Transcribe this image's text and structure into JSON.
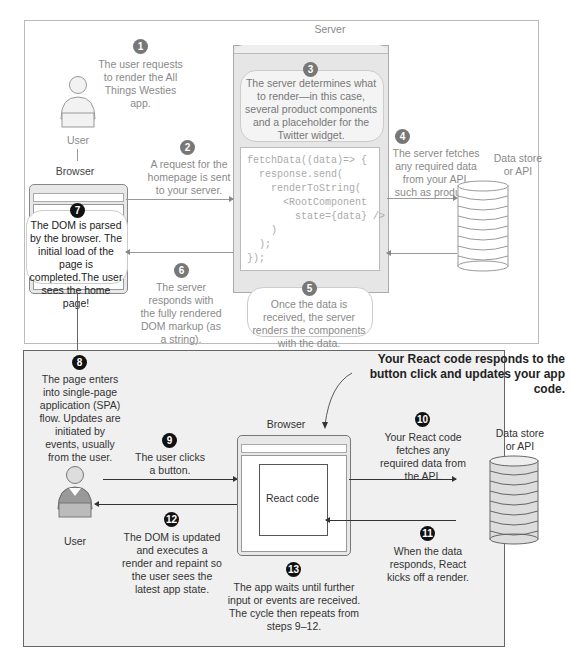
{
  "top_section": {
    "server_label": "Server",
    "user_label": "User",
    "browser_label": "Browser",
    "datastore_label": "Data store\nor API",
    "steps": [
      {
        "n": "1",
        "text": "The user requests to render the All Things Westies app."
      },
      {
        "n": "2",
        "text": "A request for the homepage is sent to your server."
      },
      {
        "n": "3",
        "text": "The server determines what to render—in this case, several product components and a placeholder for the Twitter widget."
      },
      {
        "n": "4",
        "text": "The server fetches any required data from your API, such as products."
      },
      {
        "n": "5",
        "text": "Once the data is received, the server renders the components with the data."
      },
      {
        "n": "6",
        "text": "The server responds with the fully rendered DOM markup (as a string)."
      },
      {
        "n": "7",
        "text": "The DOM is parsed by the browser. The initial load of the page is completed.The user sees the home page!"
      }
    ],
    "code_lines": [
      "fetchData((data)=> {",
      "  response.send(",
      "    renderToString(",
      "      <RootComponent",
      "        state={data} />",
      "    )",
      "  );",
      "});"
    ]
  },
  "bottom_section": {
    "callout": "Your React code responds to the button click and updates your app code.",
    "browser_label": "Browser",
    "react_code_label": "React code",
    "user_label": "User",
    "datastore_label": "Data store\nor API",
    "steps": [
      {
        "n": "8",
        "text": "The page enters into single-page application (SPA) flow. Updates are initiated by events, usually from the user."
      },
      {
        "n": "9",
        "text": "The user clicks a button."
      },
      {
        "n": "10",
        "text": "Your React code fetches any required data from the API."
      },
      {
        "n": "11",
        "text": "When the data responds, React kicks off a render."
      },
      {
        "n": "12",
        "text": "The DOM is updated and executes a render and repaint so the user sees the latest app state."
      },
      {
        "n": "13",
        "text": "The app waits until further input or events are received. The cycle then repeats from steps 9–12."
      }
    ]
  },
  "colors": {
    "top_text": "#8a8a8a",
    "bottom_text": "#333333",
    "bottom_panel_bg": "#f0f0f0",
    "step_badge_top": "#777777",
    "step_badge_bottom": "#111111"
  }
}
